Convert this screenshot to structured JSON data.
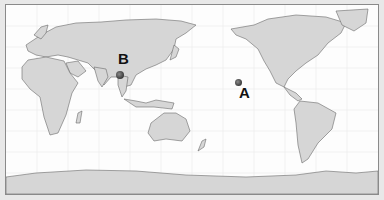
{
  "map": {
    "type": "world-map",
    "projection": "equirectangular-pacific-centered",
    "style": "grayscale",
    "colors": {
      "land": "#d6d6d6",
      "ocean": "#fdfdfd",
      "border": "#6a6a6a",
      "frame": "#8a8a8a",
      "marker": "#3a3a3a"
    }
  },
  "markers": [
    {
      "id": "A",
      "label": "A",
      "region": "central North Pacific (near Hawaii)"
    },
    {
      "id": "B",
      "label": "B",
      "region": "southern China / Myanmar border (Yunnan)"
    }
  ]
}
